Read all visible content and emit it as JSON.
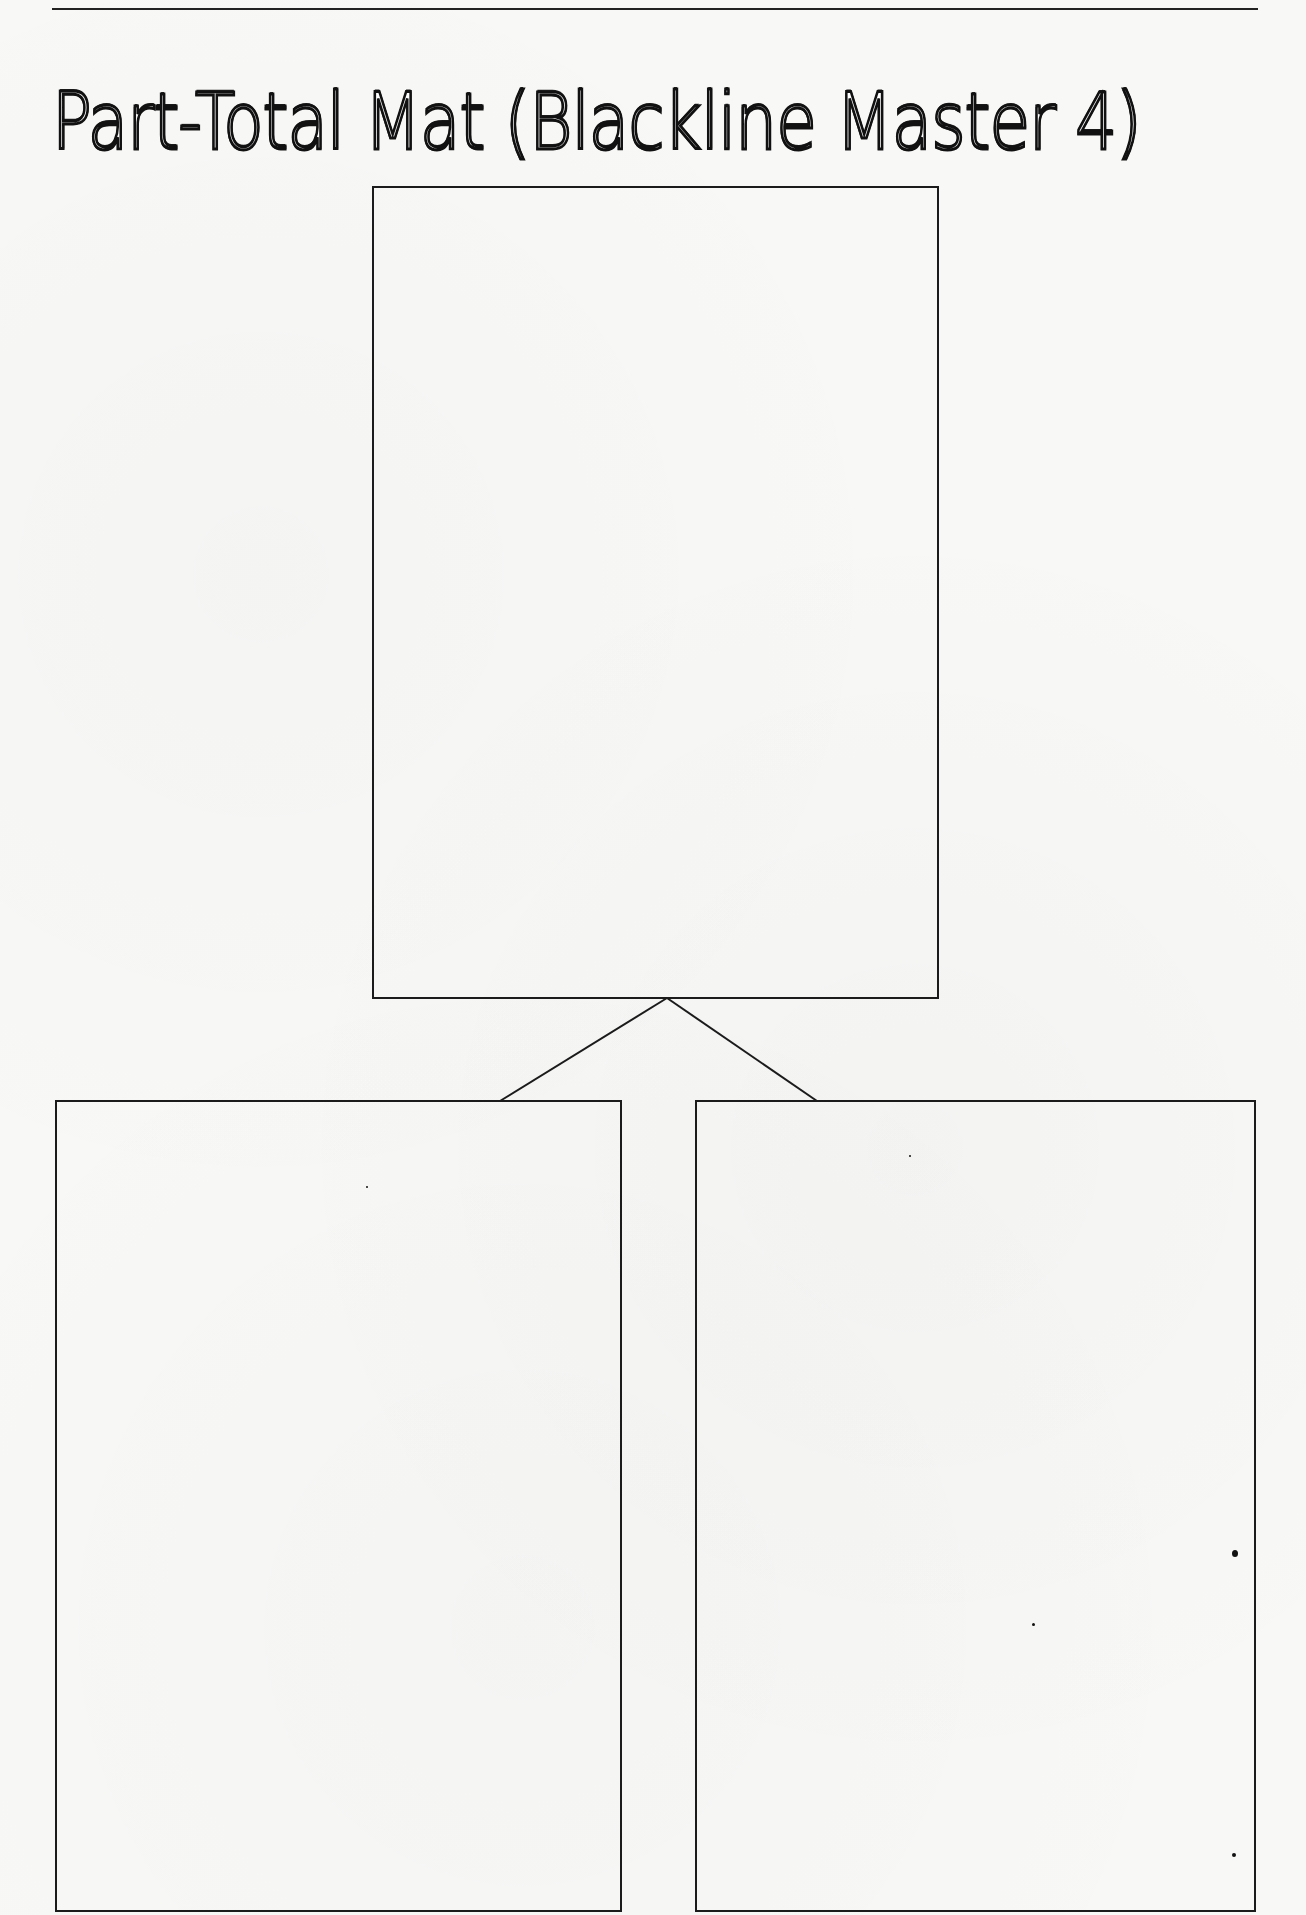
{
  "document": {
    "title": "Part-Total Mat (Blackline Master 4)",
    "header_cut_text": ""
  },
  "mat": {
    "total_box": {
      "label": "Total"
    },
    "part_boxes": [
      {
        "label": "Part"
      },
      {
        "label": "Part"
      }
    ]
  },
  "colors": {
    "line": "#1b1b1b",
    "paper": "#f8f8f7"
  }
}
